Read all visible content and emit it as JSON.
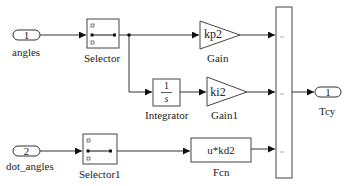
{
  "diagram": {
    "type": "simulink-block-diagram",
    "blocks": {
      "inport1": {
        "number": "1",
        "label": "angles"
      },
      "inport2": {
        "number": "2",
        "label": "dot_angles"
      },
      "selector": {
        "label": "Selector"
      },
      "selector1": {
        "label": "Selector1"
      },
      "gain": {
        "value": "kp2",
        "label": "Gain"
      },
      "gain1": {
        "value": "ki2",
        "label": "Gain1"
      },
      "integrator": {
        "numerator": "1",
        "denominator": "s",
        "label": "Integrator"
      },
      "fcn": {
        "expression": "u*kd2",
        "label": "Fcn"
      },
      "mux": {
        "label": "",
        "inputs": 3
      },
      "outport": {
        "number": "1",
        "label": "Tcy"
      }
    },
    "connections": [
      {
        "from": "angles",
        "to": "Selector"
      },
      {
        "from": "Selector",
        "to": "Gain"
      },
      {
        "from": "Selector",
        "to": "Integrator"
      },
      {
        "from": "Integrator",
        "to": "Gain1"
      },
      {
        "from": "Gain",
        "to": "Mux.in1"
      },
      {
        "from": "Gain1",
        "to": "Mux.in2"
      },
      {
        "from": "dot_angles",
        "to": "Selector1"
      },
      {
        "from": "Selector1",
        "to": "Fcn"
      },
      {
        "from": "Fcn",
        "to": "Mux.in3"
      },
      {
        "from": "Mux",
        "to": "Tcy"
      }
    ],
    "colors": {
      "line": "#333333",
      "block_border": "#444444",
      "background": "#ffffff"
    }
  }
}
